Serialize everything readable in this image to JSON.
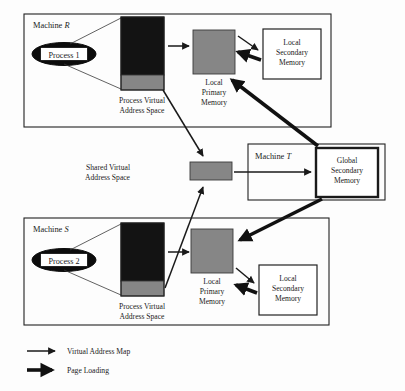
{
  "diagram": {
    "colors": {
      "gray_block": "#868686",
      "black_block": "#131313",
      "line": "#1a1a1a",
      "background": "#fdfdfd"
    },
    "machines": [
      {
        "id": "machine-r",
        "label_prefix": "Machine ",
        "label_italic": "R",
        "process": {
          "label": "Process 1"
        },
        "vas_caption_line1": "Process Virtual",
        "vas_caption_line2": "Address Space",
        "primary_caption_line1": "Local",
        "primary_caption_line2": "Primary",
        "primary_caption_line3": "Memory",
        "secondary_caption_line1": "Local",
        "secondary_caption_line2": "Secondary",
        "secondary_caption_line3": "Memory"
      },
      {
        "id": "machine-s",
        "label_prefix": "Machine ",
        "label_italic": "S",
        "process": {
          "label": "Process 2"
        },
        "vas_caption_line1": "Process Virtual",
        "vas_caption_line2": "Address Space",
        "primary_caption_line1": "Local",
        "primary_caption_line2": "Primary",
        "primary_caption_line3": "Memory",
        "secondary_caption_line1": "Local",
        "secondary_caption_line2": "Secondary",
        "secondary_caption_line3": "Memory"
      }
    ],
    "machine_t": {
      "id": "machine-t",
      "label_prefix": "Machine ",
      "label_italic": "T",
      "global_caption_line1": "Global",
      "global_caption_line2": "Secondary",
      "global_caption_line3": "Memory"
    },
    "shared": {
      "caption_line1": "Shared Virtual",
      "caption_line2": "Address Space"
    },
    "legend": {
      "items": [
        {
          "icon": "thin-arrow-icon",
          "label": "Virtual Address Map"
        },
        {
          "icon": "thick-arrow-icon",
          "label": "Page Loading"
        }
      ]
    }
  }
}
